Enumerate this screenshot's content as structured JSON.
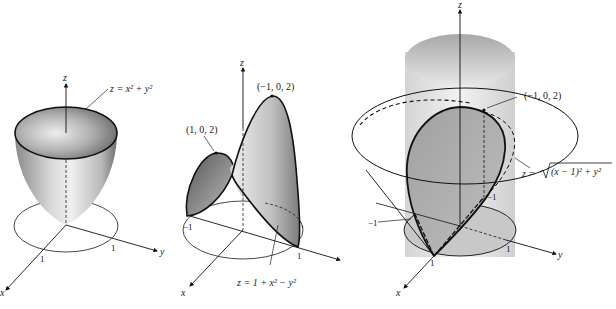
{
  "figure": {
    "panels": [
      {
        "id": "paraboloid",
        "surface_label": "z = x² + y²",
        "axes": {
          "x": "x",
          "y": "y",
          "z": "z"
        },
        "ticks": {
          "x": "1",
          "y": "1"
        }
      },
      {
        "id": "saddle",
        "surface_label": "z = 1 + x² − y²",
        "points": [
          "(1, 0, 2)",
          "(−1, 0, 2)"
        ],
        "axes": {
          "x": "x",
          "y": "y",
          "z": "z"
        },
        "ticks": {
          "neg": "−1",
          "y": "1"
        }
      },
      {
        "id": "cone-cylinder",
        "surface_label_prefix": "z =",
        "surface_label_radicand": "(x − 1)² + y²",
        "points": [
          "(−1, 0, 2)"
        ],
        "axes": {
          "x": "x",
          "y": "y",
          "z": "z"
        },
        "ticks": {
          "neg_left": "−1",
          "neg_right": "−1",
          "x": "1",
          "y": "1"
        }
      }
    ],
    "colors": {
      "ink": "#111111",
      "surface_light": "#e6e6e6",
      "surface_dark": "#7a7a7a",
      "background": "#ffffff"
    }
  }
}
